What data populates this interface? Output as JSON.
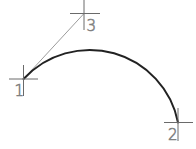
{
  "diagram": {
    "colors": {
      "background": "#ffffff",
      "arc": "#222222",
      "construction_line": "#9c9c9c",
      "marker": "#6a6a6a",
      "label": "#808080"
    },
    "points": [
      {
        "id": "1",
        "label": "1",
        "role": "arc-start",
        "x": 23.5,
        "y": 79
      },
      {
        "id": "2",
        "label": "2",
        "role": "arc-end",
        "x": 178,
        "y": 122.5
      },
      {
        "id": "3",
        "label": "3",
        "role": "tangent-direction",
        "x": 84,
        "y": 13.5
      }
    ],
    "construction_line": {
      "from": "1",
      "to": "3"
    },
    "arc": {
      "from": "1",
      "to": "2",
      "radius": 90,
      "center": {
        "x": 89.7,
        "y": 140.1
      }
    }
  }
}
